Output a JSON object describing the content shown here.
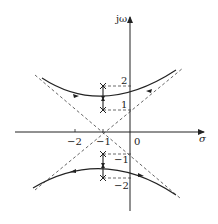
{
  "diagram": {
    "type": "root-locus",
    "axes": {
      "x_label": "σ",
      "y_label": "jω",
      "x_ticks": [
        {
          "value": -2,
          "label": "−2"
        },
        {
          "value": -1,
          "label": "−1"
        },
        {
          "value": 0,
          "label": "0"
        }
      ],
      "y_ticks": [
        {
          "value": 2,
          "label": "2"
        },
        {
          "value": 1,
          "label": "1"
        },
        {
          "value": -1,
          "label": "−1"
        },
        {
          "value": -2,
          "label": "−2"
        }
      ]
    },
    "poles": [
      {
        "re": -1,
        "im": 2
      },
      {
        "re": -1,
        "im": 1
      },
      {
        "re": -1,
        "im": -1
      },
      {
        "re": -1,
        "im": -2
      }
    ],
    "asymptote_center": {
      "re": -1,
      "im": 0
    },
    "asymptote_angles_deg": [
      45,
      135,
      225,
      315
    ],
    "branches": [
      {
        "name": "upper-branch",
        "vertex": {
          "re": -1,
          "im": 1.4
        }
      },
      {
        "name": "lower-branch",
        "vertex": {
          "re": -1,
          "im": -1.4
        }
      }
    ],
    "colors": {
      "line": "#222222",
      "dashed": "#555555"
    }
  }
}
